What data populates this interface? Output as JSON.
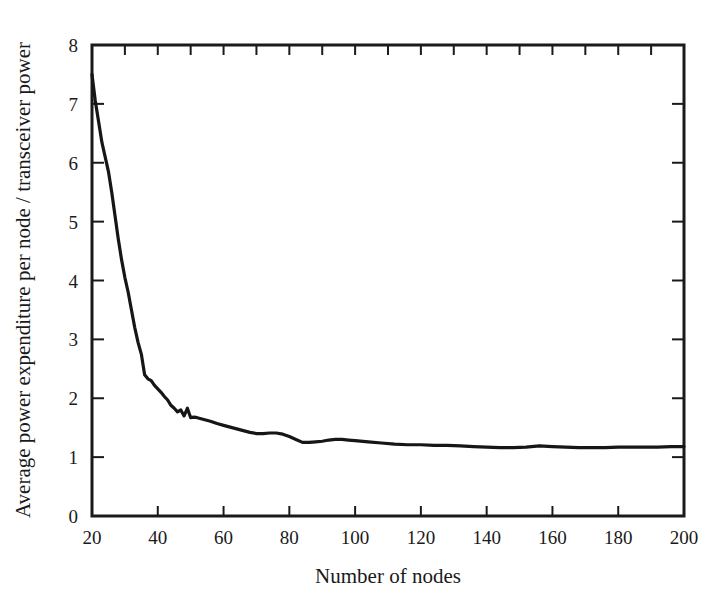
{
  "figure": {
    "background_color": "#ffffff",
    "line_color": "#161616",
    "text_color": "#1a1a1a"
  },
  "chart_data": {
    "type": "line",
    "title": "",
    "xlabel": "Number of nodes",
    "ylabel": "Average power expenditure per node / transceiver power",
    "xlim": [
      20,
      200
    ],
    "ylim": [
      0,
      8
    ],
    "grid": false,
    "legend": null,
    "x_ticks": [
      20,
      40,
      60,
      80,
      100,
      120,
      140,
      160,
      180,
      200
    ],
    "x_tick_labels": [
      "20",
      "40",
      "60",
      "80",
      "100",
      "120",
      "140",
      "160",
      "180",
      "200"
    ],
    "x_minor_ticks": [
      30,
      50,
      70,
      90,
      110,
      130,
      150,
      170,
      190
    ],
    "y_ticks": [
      0,
      1,
      2,
      3,
      4,
      5,
      6,
      7,
      8
    ],
    "y_tick_labels": [
      "0",
      "1",
      "2",
      "3",
      "4",
      "5",
      "6",
      "7",
      "8"
    ],
    "tick_direction": "in",
    "frame": "box",
    "series": [
      {
        "name": "Average power expenditure per node",
        "x": [
          20,
          21,
          22,
          23,
          24,
          25,
          26,
          27,
          28,
          29,
          30,
          31,
          32,
          33,
          34,
          35,
          36,
          37,
          38,
          39,
          40,
          41,
          42,
          43,
          44,
          45,
          46,
          47,
          48,
          49,
          50,
          51,
          52,
          54,
          56,
          58,
          60,
          62,
          64,
          66,
          68,
          70,
          72,
          74,
          76,
          78,
          80,
          82,
          84,
          86,
          88,
          90,
          92,
          94,
          96,
          98,
          100,
          104,
          108,
          112,
          116,
          120,
          124,
          128,
          132,
          136,
          140,
          144,
          148,
          152,
          156,
          160,
          164,
          168,
          172,
          176,
          180,
          184,
          188,
          192,
          196,
          200
        ],
        "y": [
          7.5,
          7.05,
          6.7,
          6.35,
          6.1,
          5.85,
          5.5,
          5.1,
          4.7,
          4.35,
          4.05,
          3.8,
          3.5,
          3.2,
          2.95,
          2.75,
          2.4,
          2.33,
          2.3,
          2.22,
          2.16,
          2.1,
          2.03,
          1.97,
          1.88,
          1.83,
          1.77,
          1.8,
          1.7,
          1.83,
          1.67,
          1.68,
          1.67,
          1.64,
          1.61,
          1.57,
          1.54,
          1.51,
          1.48,
          1.45,
          1.42,
          1.4,
          1.4,
          1.41,
          1.41,
          1.39,
          1.35,
          1.3,
          1.25,
          1.25,
          1.26,
          1.27,
          1.29,
          1.3,
          1.3,
          1.29,
          1.28,
          1.26,
          1.24,
          1.22,
          1.21,
          1.21,
          1.2,
          1.2,
          1.19,
          1.18,
          1.17,
          1.16,
          1.16,
          1.17,
          1.19,
          1.18,
          1.17,
          1.16,
          1.16,
          1.16,
          1.17,
          1.17,
          1.17,
          1.17,
          1.18,
          1.18
        ]
      }
    ]
  }
}
